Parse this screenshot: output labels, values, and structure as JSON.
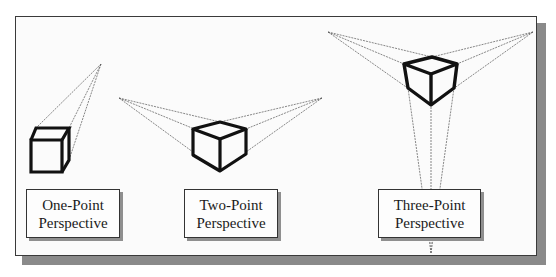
{
  "figure": {
    "labels": [
      {
        "line1": "One-Point",
        "line2": "Perspective"
      },
      {
        "line1": "Two-Point",
        "line2": "Perspective"
      },
      {
        "line1": "Three-Point",
        "line2": "Perspective"
      }
    ]
  },
  "colors": {
    "frame_border": "#3a3a3a",
    "shadow": "#8a8a8a",
    "cube_stroke": "#111111",
    "projection_line": "#555555"
  }
}
